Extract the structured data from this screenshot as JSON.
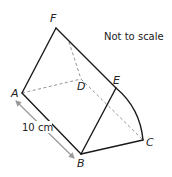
{
  "diagram": {
    "note": "Not to scale",
    "dimension_label": "10 cm",
    "vertices": {
      "A": {
        "label": "A",
        "x": 22,
        "y": 93
      },
      "B": {
        "label": "B",
        "x": 81,
        "y": 154
      },
      "C": {
        "label": "C",
        "x": 143,
        "y": 140
      },
      "D": {
        "label": "D",
        "x": 81,
        "y": 79
      },
      "E": {
        "label": "E",
        "x": 116,
        "y": 88
      },
      "F": {
        "label": "F",
        "x": 56,
        "y": 28
      }
    },
    "colors": {
      "line": "#1a1a1a",
      "hidden": "#888888",
      "arrow": "#999999"
    }
  }
}
